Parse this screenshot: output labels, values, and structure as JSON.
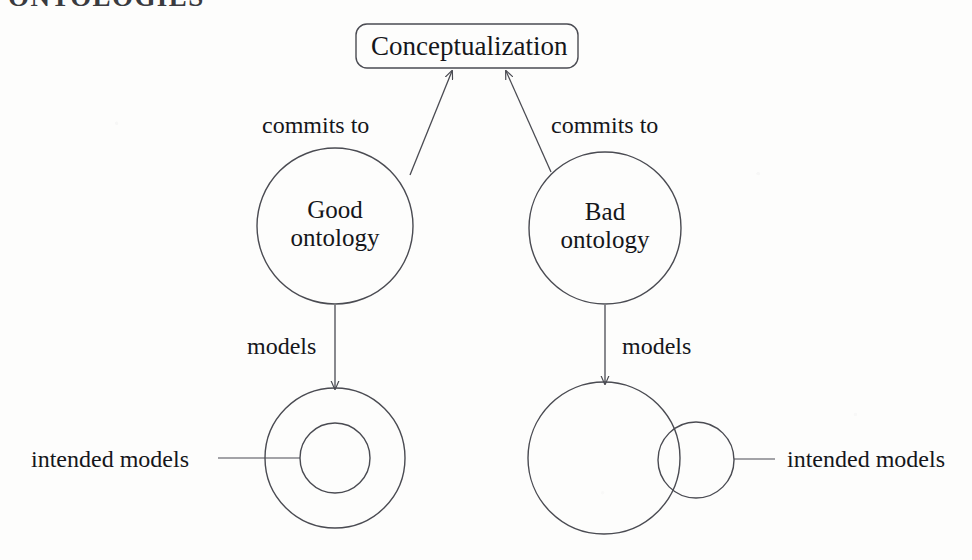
{
  "heading": "ONTOLOGIES",
  "diagram": {
    "type": "node-link-diagram",
    "colors": {
      "background": "#fdfdfc",
      "stroke": "#4a4b52",
      "text": "#15161a"
    },
    "root_box": {
      "label": "Conceptualization",
      "shape": "rounded-rectangle"
    },
    "edges": [
      {
        "label": "commits to",
        "from": "good-ontology",
        "to": "conceptualization",
        "arrow": true
      },
      {
        "label": "commits to",
        "from": "bad-ontology",
        "to": "conceptualization",
        "arrow": true
      },
      {
        "label": "models",
        "from": "good-ontology",
        "to": "good-models-set",
        "arrow": true
      },
      {
        "label": "models",
        "from": "bad-ontology",
        "to": "bad-models-set",
        "arrow": true
      }
    ],
    "nodes": [
      {
        "id": "good-ontology",
        "label_line1": "Good",
        "label_line2": "ontology",
        "shape": "circle"
      },
      {
        "id": "bad-ontology",
        "label_line1": "Bad",
        "label_line2": "ontology",
        "shape": "circle"
      }
    ],
    "model_sets": [
      {
        "id": "good-models-set",
        "arrangement": "concentric",
        "callout": "intended models",
        "callout_side": "left"
      },
      {
        "id": "bad-models-set",
        "arrangement": "overlapping",
        "callout": "intended models",
        "callout_side": "right"
      }
    ]
  }
}
